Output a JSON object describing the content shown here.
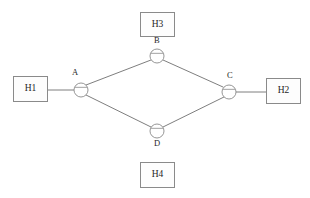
{
  "diagram": {
    "title_artifact": "the faint cropped line of text at the very top edge of the scan",
    "artifact_text": "··  · ···   ········ ····  · ··  ······ ···· ··",
    "background_color": "#ffffff",
    "stroke_color": "#8a8a8a",
    "edge_color": "#6f6f6f",
    "text_color": "#262626",
    "hosts": [
      {
        "id": "h1",
        "label": "H1",
        "x": 13,
        "y": 76,
        "w": 35,
        "h": 26
      },
      {
        "id": "h2",
        "label": "H2",
        "x": 266,
        "y": 78,
        "w": 35,
        "h": 26
      },
      {
        "id": "h3",
        "label": "H3",
        "x": 140,
        "y": 12,
        "w": 35,
        "h": 25
      },
      {
        "id": "h4",
        "label": "H4",
        "x": 140,
        "y": 162,
        "w": 35,
        "h": 26
      }
    ],
    "routers": [
      {
        "id": "a",
        "label": "A",
        "cx": 81,
        "cy": 90,
        "r": 7,
        "label_x": 72,
        "label_y": 68
      },
      {
        "id": "b",
        "label": "B",
        "cx": 157,
        "cy": 56,
        "r": 7,
        "label_x": 154,
        "label_y": 36
      },
      {
        "id": "c",
        "label": "C",
        "cx": 229,
        "cy": 92,
        "r": 7,
        "label_x": 227,
        "label_y": 71
      },
      {
        "id": "d",
        "label": "D",
        "cx": 157,
        "cy": 131,
        "r": 7,
        "label_x": 154,
        "label_y": 139
      }
    ],
    "links": [
      {
        "id": "h1-a",
        "from": "H1",
        "to": "A",
        "x1": 48,
        "y1": 90,
        "x2": 74,
        "y2": 90
      },
      {
        "id": "a-b",
        "from": "A",
        "to": "B",
        "x1": 86,
        "y1": 85,
        "x2": 151,
        "y2": 60
      },
      {
        "id": "b-c",
        "from": "B",
        "to": "C",
        "x1": 163,
        "y1": 60,
        "x2": 223,
        "y2": 87
      },
      {
        "id": "a-d",
        "from": "A",
        "to": "D",
        "x1": 86,
        "y1": 95,
        "x2": 151,
        "y2": 127
      },
      {
        "id": "d-c",
        "from": "D",
        "to": "C",
        "x1": 163,
        "y1": 127,
        "x2": 224,
        "y2": 97
      },
      {
        "id": "c-h2",
        "from": "C",
        "to": "H2",
        "x1": 236,
        "y1": 92,
        "x2": 266,
        "y2": 92
      }
    ]
  }
}
